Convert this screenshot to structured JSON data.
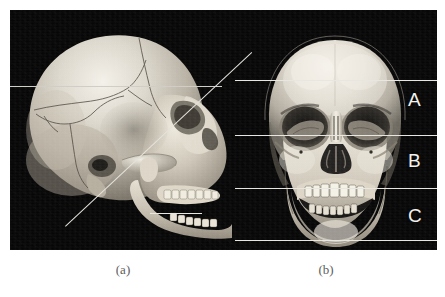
{
  "figure": {
    "caption_a": "(a)",
    "caption_b": "(b)",
    "panel_a_name": "lateral-skull-view",
    "panel_b_name": "frontal-skull-view",
    "background_color": "#ffffff",
    "plate_color": "#060606",
    "line_color": "#e8e6e0",
    "letter_color": "#f2f1ed"
  },
  "regions": [
    {
      "label": "A",
      "name": "upper-facial-third"
    },
    {
      "label": "B",
      "name": "middle-facial-third"
    },
    {
      "label": "C",
      "name": "lower-facial-third"
    }
  ],
  "guides": {
    "lateral": [
      {
        "name": "lateral-horizontal-guide-upper"
      },
      {
        "name": "lateral-short-guide-lower"
      },
      {
        "name": "lateral-oblique-guide"
      }
    ],
    "frontal": [
      {
        "name": "frontal-guide-trichion"
      },
      {
        "name": "frontal-guide-glabella"
      },
      {
        "name": "frontal-guide-subnasale"
      },
      {
        "name": "frontal-guide-menton"
      }
    ]
  }
}
